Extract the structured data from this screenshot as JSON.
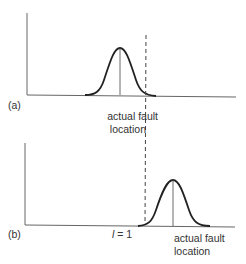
{
  "panels": [
    {
      "id": "a",
      "tag": "(a)",
      "annotation_line1": "actual fault",
      "annotation_line2": "location"
    },
    {
      "id": "b",
      "tag": "(b)",
      "annotation_line1": "actual fault",
      "annotation_line2": "location",
      "threshold_label_var": "l",
      "threshold_label_rest": " = 1"
    }
  ]
}
